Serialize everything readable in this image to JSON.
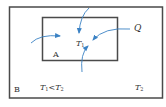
{
  "diagram": {
    "type": "heat-transfer-schematic",
    "outer_region": {
      "label": "B",
      "temperature": "T₂"
    },
    "inner_region": {
      "label": "A",
      "temperature": "T₁"
    },
    "condition": {
      "lhs": "T",
      "lhs_sub": "1",
      "op": "<",
      "rhs": "T",
      "rhs_sub": "2"
    },
    "heat_label": "Q",
    "labels": {
      "A": "A",
      "B": "B",
      "T1_main": "T",
      "T1_sub": "1",
      "T2_main": "T",
      "T2_sub": "2",
      "Q": "Q"
    },
    "arrows": [
      {
        "name": "heat-arrow-left",
        "from": "outside-left",
        "to": "inside-A"
      },
      {
        "name": "heat-arrow-top",
        "from": "outside-top",
        "to": "inside-A"
      },
      {
        "name": "heat-arrow-right",
        "from": "Q",
        "to": "inside-A"
      },
      {
        "name": "heat-arrow-bottom",
        "from": "outside-bottom",
        "to": "inside-A"
      }
    ],
    "colors": {
      "border": "#4a4a4a",
      "arrow": "#3b82c4",
      "text": "#333333"
    }
  }
}
